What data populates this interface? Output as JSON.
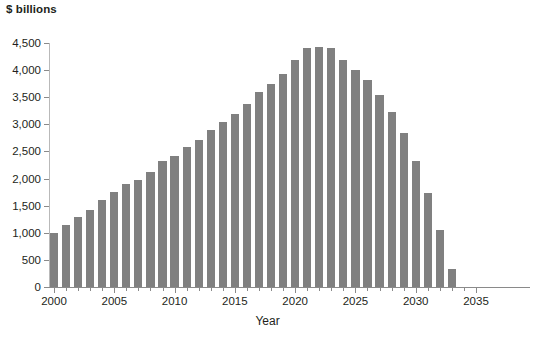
{
  "chart_data": {
    "type": "bar",
    "title": "",
    "subtitle": "",
    "xlabel": "Year",
    "ylabel": "$ billions",
    "y_unit_title": "$ billions",
    "grid": false,
    "legend": null,
    "xlim": [
      2000,
      2035
    ],
    "ylim": [
      0,
      4500
    ],
    "y_ticks": [
      0,
      500,
      1000,
      1500,
      2000,
      2500,
      3000,
      3500,
      4000,
      4500
    ],
    "y_tick_labels": [
      "0",
      "500",
      "1,000",
      "1,500",
      "2,000",
      "2,500",
      "3,000",
      "3,500",
      "4,000",
      "4,500"
    ],
    "x_ticks_major": [
      2000,
      2005,
      2010,
      2015,
      2020,
      2025,
      2030,
      2035
    ],
    "x_tick_labels": [
      "2000",
      "2005",
      "2010",
      "2015",
      "2020",
      "2025",
      "2030",
      "2035"
    ],
    "x_minor_tick_step": 1,
    "bar_color": "#808080",
    "axis_color": "#8a8a8a",
    "text_color": "#231f20",
    "categories": [
      2000,
      2001,
      2002,
      2003,
      2004,
      2005,
      2006,
      2007,
      2008,
      2009,
      2010,
      2011,
      2012,
      2013,
      2014,
      2015,
      2016,
      2017,
      2018,
      2019,
      2020,
      2021,
      2022,
      2023,
      2024,
      2025,
      2026,
      2027,
      2028,
      2029,
      2030,
      2031,
      2032,
      2033
    ],
    "values": [
      1000,
      1150,
      1300,
      1420,
      1600,
      1750,
      1900,
      1980,
      2120,
      2320,
      2420,
      2580,
      2720,
      2900,
      3050,
      3200,
      3380,
      3600,
      3750,
      3920,
      4180,
      4400,
      4420,
      4400,
      4180,
      4000,
      3820,
      3550,
      3230,
      2840,
      2330,
      1730,
      1060,
      330
    ]
  }
}
